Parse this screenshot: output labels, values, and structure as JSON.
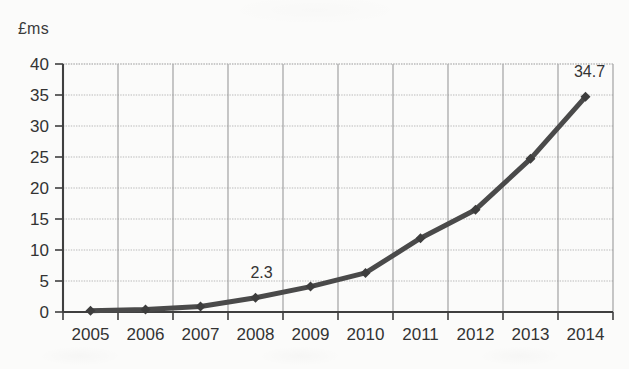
{
  "chart_data": {
    "type": "line",
    "title": "",
    "subtitle": "",
    "ylabel": "£ms",
    "xlabel": "",
    "categories": [
      "2005",
      "2006",
      "2007",
      "2008",
      "2009",
      "2010",
      "2011",
      "2012",
      "2013",
      "2014"
    ],
    "x": [
      2005,
      2006,
      2007,
      2008,
      2009,
      2010,
      2011,
      2012,
      2013,
      2014
    ],
    "values": [
      0.2,
      0.4,
      0.9,
      2.3,
      4.1,
      6.3,
      11.9,
      16.5,
      24.7,
      34.7
    ],
    "series": [
      {
        "name": "",
        "values": [
          0.2,
          0.4,
          0.9,
          2.3,
          4.1,
          6.3,
          11.9,
          16.5,
          24.7,
          34.7
        ]
      }
    ],
    "ylim": [
      0,
      40
    ],
    "yticks": [
      0,
      5,
      10,
      15,
      20,
      25,
      30,
      35,
      40
    ],
    "ytick_labels": [
      "0",
      "5",
      "10",
      "15",
      "20",
      "25",
      "30",
      "35",
      "40"
    ],
    "xtick_labels": [
      "2005",
      "2006",
      "2007",
      "2008",
      "2009",
      "2010",
      "2011",
      "2012",
      "2013",
      "2014"
    ],
    "grid": true,
    "grid_axes": "both",
    "legend": false,
    "legend_position": "none",
    "annotations": [
      {
        "text": "2.3",
        "at_category": "2008",
        "value": 2.3
      },
      {
        "text": "34.7",
        "at_category": "2014",
        "value": 34.7
      }
    ],
    "marker": "diamond",
    "colors": {
      "line": "#4a4a4a",
      "marker": "#3d3d3d",
      "grid": "#b9b9b9",
      "axis": "#3f3f3f",
      "text": "#333333",
      "background": "#fbfbfa"
    }
  }
}
